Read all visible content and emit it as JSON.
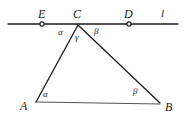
{
  "figure": {
    "background_color": "#ffffff",
    "stroke_color": "#1a1a1a",
    "label_color": "#1a1a1a"
  },
  "points": {
    "E": {
      "label": "E",
      "x": 42,
      "y": 24,
      "marker": "open-circle",
      "label_x": 38,
      "label_y": 8
    },
    "C": {
      "label": "C",
      "x": 78,
      "y": 25,
      "marker": "none",
      "label_x": 73,
      "label_y": 8
    },
    "D": {
      "label": "D",
      "x": 129,
      "y": 24,
      "marker": "open-circle",
      "label_x": 124,
      "label_y": 8
    },
    "A": {
      "label": "A",
      "x": 36,
      "y": 102,
      "marker": "none",
      "label_x": 20,
      "label_y": 100
    },
    "B": {
      "label": "B",
      "x": 160,
      "y": 103,
      "marker": "none",
      "label_x": 165,
      "label_y": 101
    }
  },
  "line": {
    "name": "l",
    "label": "l",
    "label_x": 161,
    "label_y": 8,
    "x1": 8,
    "y1": 24,
    "x2": 178,
    "y2": 24
  },
  "segments": [
    {
      "name": "segment-CA",
      "x1": 78,
      "y1": 25,
      "x2": 36,
      "y2": 102
    },
    {
      "name": "segment-CB",
      "x1": 78,
      "y1": 25,
      "x2": 160,
      "y2": 103
    },
    {
      "name": "segment-AB",
      "x1": 36,
      "y1": 102,
      "x2": 160,
      "y2": 104
    }
  ],
  "angles": [
    {
      "name": "angle-alpha-at-C",
      "label": "α",
      "x": 58,
      "y": 28
    },
    {
      "name": "angle-beta-at-C",
      "label": "β",
      "x": 94,
      "y": 27
    },
    {
      "name": "angle-gamma-at-C",
      "label": "γ",
      "x": 75,
      "y": 33
    },
    {
      "name": "angle-alpha-at-A",
      "label": "α",
      "x": 43,
      "y": 90
    },
    {
      "name": "angle-beta-at-B",
      "label": "β",
      "x": 133,
      "y": 87
    }
  ]
}
